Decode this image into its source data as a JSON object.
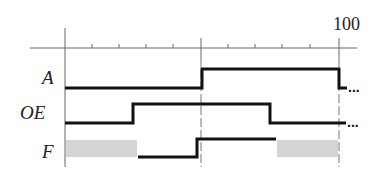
{
  "diagram": {
    "type": "timing-diagram",
    "axis": {
      "end_label": "100",
      "x_origin": 65,
      "x_end": 339,
      "y": 48,
      "ticks_x": [
        92,
        119,
        146,
        173,
        201,
        228,
        255,
        282,
        310,
        339
      ],
      "dashed_markers_x": [
        201,
        339
      ]
    },
    "signals": [
      {
        "name": "A",
        "label_y": 77,
        "high_y": 69,
        "low_y": 88,
        "path": [
          [
            65,
            88
          ],
          [
            202,
            88
          ],
          [
            202,
            69
          ],
          [
            339,
            69
          ],
          [
            339,
            88
          ],
          [
            347,
            88
          ]
        ],
        "continues": "..."
      },
      {
        "name": "OE",
        "label_y": 112,
        "high_y": 104,
        "low_y": 123,
        "path": [
          [
            65,
            123
          ],
          [
            133,
            123
          ],
          [
            133,
            104
          ],
          [
            270,
            104
          ],
          [
            270,
            123
          ],
          [
            346,
            123
          ]
        ],
        "continues": "..."
      },
      {
        "name": "F",
        "label_y": 155,
        "high_y": 139,
        "low_y": 157,
        "path": [
          [
            138,
            157
          ],
          [
            197,
            157
          ],
          [
            197,
            139
          ],
          [
            276,
            139
          ]
        ],
        "undefined_regions": [
          [
            66,
            137
          ],
          [
            277,
            338
          ]
        ]
      }
    ],
    "colors": {
      "line": "#111111",
      "axis": "#555555",
      "undefined_fill": "#d4d4d4"
    }
  }
}
